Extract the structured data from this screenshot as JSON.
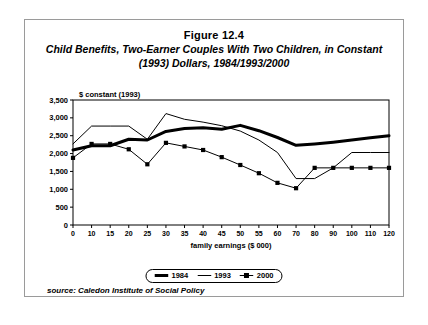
{
  "figure": {
    "number": "Figure 12.4",
    "title": "Child Benefits, Two-Earner Couples With Two Children, in Constant (1993) Dollars, 1984/1993/2000",
    "source": "source: Caledon Institute of Social Policy"
  },
  "legend": {
    "items": [
      {
        "label": "1984",
        "style": "thick-solid",
        "color": "#000000"
      },
      {
        "label": "1993",
        "style": "thin-solid",
        "color": "#000000"
      },
      {
        "label": "2000",
        "style": "thin-solid-square-marker",
        "color": "#000000"
      }
    ]
  },
  "chart_data": {
    "type": "line",
    "title": "Child Benefits, Two-Earner Couples With Two Children, in Constant (1993) Dollars, 1984/1993/2000",
    "xlabel": "family earnings ($ 000)",
    "ylabel": "$ constant (1993)",
    "unit_note": "$ constant (1993)",
    "categories": [
      "0",
      "10",
      "15",
      "20",
      "25",
      "30",
      "35",
      "40",
      "45",
      "50",
      "55",
      "60",
      "70",
      "80",
      "90",
      "100",
      "110",
      "120"
    ],
    "xtick_labels": [
      "0",
      "10",
      "15",
      "20",
      "25",
      "30",
      "35",
      "40",
      "45",
      "50",
      "55",
      "60",
      "70",
      "80",
      "90",
      "100",
      "110",
      "120"
    ],
    "ytick_labels": [
      "0",
      "500",
      "1,000",
      "1,500",
      "2,000",
      "2,500",
      "3,000",
      "3,500"
    ],
    "yticks": [
      0,
      500,
      1000,
      1500,
      2000,
      2500,
      3000,
      3500
    ],
    "ylim": [
      0,
      3500
    ],
    "grid": false,
    "legend_position": "bottom",
    "series": [
      {
        "name": "1984",
        "values": [
          2100,
          2220,
          2220,
          2400,
          2380,
          2620,
          2700,
          2720,
          2680,
          2790,
          2640,
          2450,
          2230,
          2270,
          2320,
          2380,
          2440,
          2500
        ]
      },
      {
        "name": "1993",
        "values": [
          2270,
          2770,
          2770,
          2770,
          2400,
          3120,
          2960,
          2880,
          2780,
          2630,
          2380,
          2030,
          1300,
          1300,
          1600,
          2030,
          2030,
          2030
        ]
      },
      {
        "name": "2000",
        "values": [
          1880,
          2270,
          2270,
          2120,
          1700,
          2300,
          2200,
          2100,
          1900,
          1680,
          1450,
          1180,
          1030,
          1600,
          1600,
          1600,
          1600,
          1600
        ]
      }
    ]
  }
}
